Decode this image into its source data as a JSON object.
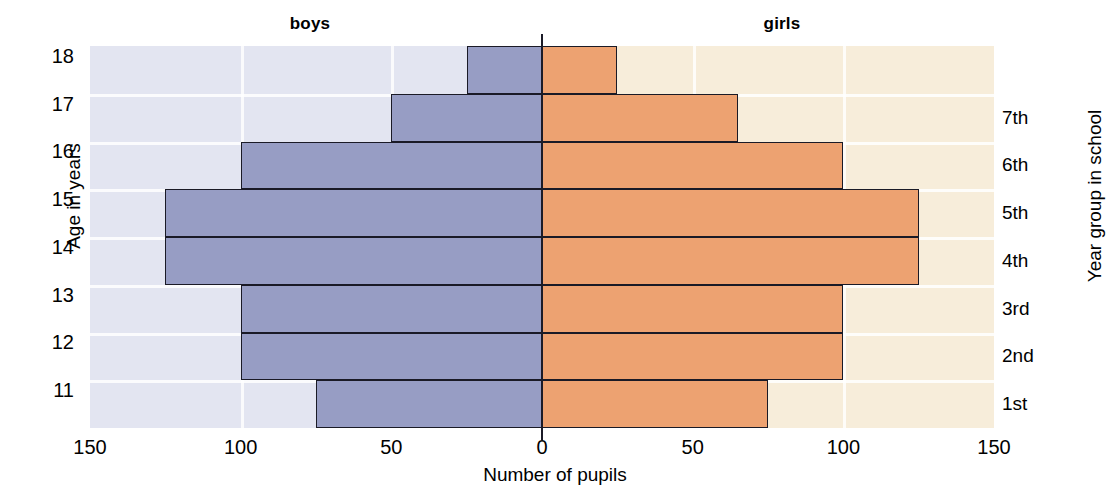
{
  "chart_data": {
    "type": "bar",
    "subtype": "population-pyramid",
    "title": "",
    "xlabel": "Number of pupils",
    "ylabel": "Age in years",
    "ylabel_secondary": "Year group in school",
    "xlim": [
      -150,
      150
    ],
    "xtick_labels_left": [
      "150",
      "100",
      "50",
      "0"
    ],
    "xtick_labels_right": [
      "50",
      "100",
      "150"
    ],
    "xticks": [
      150,
      100,
      50,
      0,
      50,
      100,
      150
    ],
    "grid": true,
    "legend_position": "top",
    "categories": [
      "18",
      "17",
      "16",
      "15",
      "14",
      "13",
      "12",
      "11"
    ],
    "categories_secondary": [
      "",
      "7th",
      "6th",
      "5th",
      "4th",
      "3rd",
      "2nd",
      "1st"
    ],
    "series": [
      {
        "name": "boys",
        "side": "left",
        "color": "#979dc4",
        "values": [
          25,
          50,
          100,
          125,
          125,
          100,
          100,
          75
        ]
      },
      {
        "name": "girls",
        "side": "right",
        "color": "#eda271",
        "values": [
          25,
          65,
          100,
          125,
          125,
          100,
          100,
          75
        ]
      }
    ],
    "panel_color_left": "#e3e5f1",
    "panel_color_right": "#f7edda",
    "axis_color": "#1a1a26"
  },
  "headers": {
    "boys": "boys",
    "girls": "girls"
  },
  "axes": {
    "x_title": "Number of pupils",
    "y_title_left": "Age in years",
    "y_title_right": "Year group in school",
    "x_ticks": [
      "150",
      "100",
      "50",
      "0",
      "50",
      "100",
      "150"
    ],
    "y_ticks_left": [
      "18",
      "17",
      "16",
      "15",
      "14",
      "13",
      "12",
      "11"
    ],
    "y_ticks_right": [
      "7th",
      "6th",
      "5th",
      "4th",
      "3rd",
      "2nd",
      "1st"
    ]
  }
}
